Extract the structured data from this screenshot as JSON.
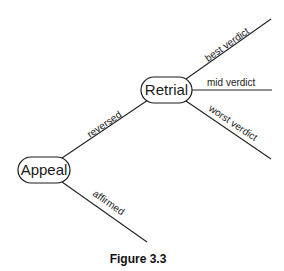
{
  "diagram": {
    "type": "decision-tree",
    "nodes": {
      "appeal": {
        "label": "Appeal"
      },
      "retrial": {
        "label": "Retrial"
      }
    },
    "edges": {
      "reversed": {
        "label": "reversed",
        "from": "Appeal",
        "to": "Retrial"
      },
      "affirmed": {
        "label": "affirmed",
        "from": "Appeal",
        "to": ""
      },
      "best_verdict": {
        "label": "best verdict",
        "from": "Retrial",
        "to": ""
      },
      "mid_verdict": {
        "label": "mid verdict",
        "from": "Retrial",
        "to": ""
      },
      "worst_verdict": {
        "label": "worst verdict",
        "from": "Retrial",
        "to": ""
      }
    },
    "caption": "Figure 3.3"
  }
}
